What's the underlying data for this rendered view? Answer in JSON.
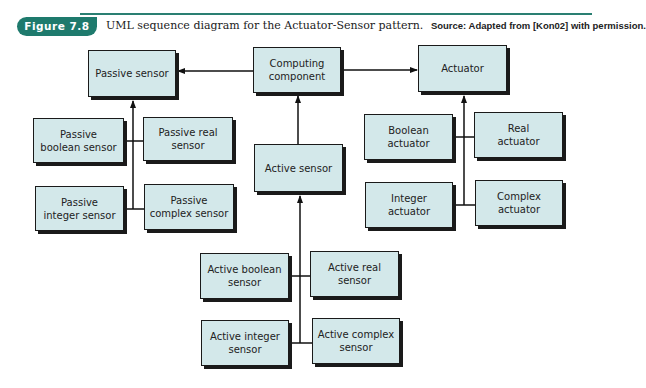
{
  "header": {
    "figure_label": "Figure 7.8",
    "caption": "UML sequence diagram for the Actuator-Sensor pattern.",
    "source": "Source: Adapted from [Kon02] with permission.",
    "accent_color": "#1e7a6d"
  },
  "diagram": {
    "top_row": {
      "passive_sensor": "Passive sensor",
      "computing_component": "Computing component",
      "actuator": "Actuator"
    },
    "passive_sensors": {
      "boolean": "Passive boolean sensor",
      "real": "Passive real sensor",
      "integer": "Passive integer sensor",
      "complex": "Passive complex sensor"
    },
    "actuators": {
      "boolean": "Boolean actuator",
      "real": "Real actuator",
      "integer": "Integer actuator",
      "complex": "Complex actuator"
    },
    "active_sensor": "Active sensor",
    "active_sensors": {
      "boolean": "Active boolean sensor",
      "real": "Active real sensor",
      "integer": "Active integer sensor",
      "complex": "Active complex sensor"
    },
    "box_fill": "#d3e8ea",
    "relationships": [
      {
        "from": "Computing component",
        "to": "Passive sensor",
        "type": "association-arrow"
      },
      {
        "from": "Computing component",
        "to": "Actuator",
        "type": "association-arrow"
      },
      {
        "from": "Active sensor",
        "to": "Computing component",
        "type": "generalization"
      },
      {
        "from": "Passive boolean sensor",
        "to": "Passive sensor",
        "type": "generalization"
      },
      {
        "from": "Passive real sensor",
        "to": "Passive sensor",
        "type": "generalization"
      },
      {
        "from": "Passive integer sensor",
        "to": "Passive sensor",
        "type": "generalization"
      },
      {
        "from": "Passive complex sensor",
        "to": "Passive sensor",
        "type": "generalization"
      },
      {
        "from": "Boolean actuator",
        "to": "Actuator",
        "type": "generalization"
      },
      {
        "from": "Real actuator",
        "to": "Actuator",
        "type": "generalization"
      },
      {
        "from": "Integer actuator",
        "to": "Actuator",
        "type": "generalization"
      },
      {
        "from": "Complex actuator",
        "to": "Actuator",
        "type": "generalization"
      },
      {
        "from": "Active boolean sensor",
        "to": "Active sensor",
        "type": "generalization"
      },
      {
        "from": "Active real sensor",
        "to": "Active sensor",
        "type": "generalization"
      },
      {
        "from": "Active integer sensor",
        "to": "Active sensor",
        "type": "generalization"
      },
      {
        "from": "Active complex sensor",
        "to": "Active sensor",
        "type": "generalization"
      }
    ]
  }
}
